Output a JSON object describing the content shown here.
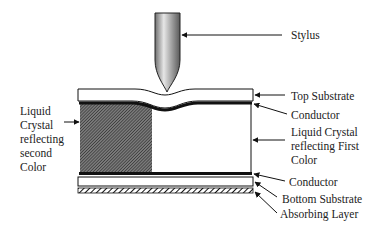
{
  "diagram": {
    "type": "cross-section",
    "colors": {
      "line": "#111111",
      "hatch": "#333333",
      "stylus_light": "#e6e6e6",
      "stylus_dark": "#6e6e6e",
      "background": "#ffffff"
    },
    "labels": {
      "stylus": "Stylus",
      "top_substrate": "Top Substrate",
      "conductor_top": "Conductor",
      "lc_first_line1": "Liquid Crystal",
      "lc_first_line2": "reflecting First",
      "lc_first_line3": "Color",
      "conductor_bottom": "Conductor",
      "bottom_substrate": "Bottom Substrate",
      "absorbing_layer": "Absorbing Layer",
      "lc_second_line1": "Liquid",
      "lc_second_line2": "Crystal",
      "lc_second_line3": "reflecting",
      "lc_second_line4": "second",
      "lc_second_line5": "Color"
    },
    "layers": [
      {
        "name": "Top Substrate"
      },
      {
        "name": "Conductor"
      },
      {
        "name": "Liquid Crystal reflecting second Color",
        "fill": "dense hatch"
      },
      {
        "name": "Liquid Crystal reflecting First Color",
        "fill": "white"
      },
      {
        "name": "Conductor"
      },
      {
        "name": "Bottom Substrate"
      },
      {
        "name": "Absorbing Layer",
        "fill": "diagonal hatch"
      }
    ]
  }
}
